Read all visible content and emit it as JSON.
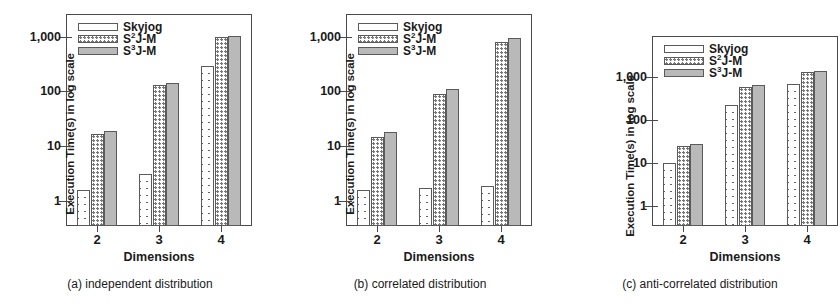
{
  "figure": {
    "background": "#ffffff",
    "series_colors": {
      "skyjog": "#ffffff",
      "s2jm": "#ffffff",
      "s3jm": "#b9b9b9",
      "axis": "#4a4a4a"
    }
  },
  "legend": {
    "entries": [
      {
        "label": "Skyjog",
        "base": "Skyjog",
        "sup": "",
        "pattern": "crosshatch"
      },
      {
        "label": "S2J-M",
        "base": "S",
        "sup": "2",
        "suffix": "J-M",
        "pattern": "dotted"
      },
      {
        "label": "S3J-M",
        "base": "S",
        "sup": "3",
        "suffix": "J-M",
        "pattern": "solid-gray"
      }
    ]
  },
  "axes": {
    "ylabel": "Execution Time(s)  in log scale",
    "xlabel": "Dimensions",
    "yticks": [
      "1",
      "10",
      "100",
      "1,000"
    ],
    "ytick_values": [
      1,
      10,
      100,
      1000
    ],
    "xticks": [
      "2",
      "3",
      "4"
    ],
    "scale": "log"
  },
  "panels": [
    {
      "id": "a",
      "caption": "(a) independent distribution",
      "ylim": [
        0.35,
        2600
      ]
    },
    {
      "id": "b",
      "caption": "(b) correlated distribution",
      "ylim": [
        0.35,
        2600
      ]
    },
    {
      "id": "c",
      "caption": "(c) anti-correlated distribution",
      "ylim": [
        0.35,
        9000
      ]
    }
  ],
  "chart_data": [
    {
      "type": "bar",
      "title": "(a) independent distribution",
      "xlabel": "Dimensions",
      "ylabel": "Execution Time(s)  in log scale",
      "yscale": "log",
      "ylim": [
        0.35,
        2600
      ],
      "yticks": [
        1,
        10,
        100,
        1000
      ],
      "ytick_labels": [
        "1",
        "10",
        "100",
        "1,000"
      ],
      "categories": [
        "2",
        "3",
        "4"
      ],
      "grid": false,
      "legend_position": "upper-left-inside",
      "series": [
        {
          "name": "Skyjog",
          "values": [
            1.6,
            3.1,
            290
          ]
        },
        {
          "name": "S2J-M",
          "values": [
            17,
            130,
            1000
          ]
        },
        {
          "name": "S3J-M",
          "values": [
            19,
            145,
            1050
          ]
        }
      ]
    },
    {
      "type": "bar",
      "title": "(b) correlated distribution",
      "xlabel": "Dimensions",
      "ylabel": "Execution Time(s)  in log scale",
      "yscale": "log",
      "ylim": [
        0.35,
        2600
      ],
      "yticks": [
        1,
        10,
        100,
        1000
      ],
      "ytick_labels": [
        "1",
        "10",
        "100",
        "1,000"
      ],
      "categories": [
        "2",
        "3",
        "4"
      ],
      "grid": false,
      "legend_position": "upper-left-inside",
      "series": [
        {
          "name": "Skyjog",
          "values": [
            1.6,
            1.7,
            1.9
          ]
        },
        {
          "name": "S2J-M",
          "values": [
            15,
            90,
            800
          ]
        },
        {
          "name": "S3J-M",
          "values": [
            18,
            110,
            950
          ]
        }
      ]
    },
    {
      "type": "bar",
      "title": "(c) anti-correlated distribution",
      "xlabel": "Dimensions",
      "ylabel": "Execution Time(s)  in log scale",
      "yscale": "log",
      "ylim": [
        0.35,
        9000
      ],
      "yticks": [
        1,
        10,
        100,
        1000
      ],
      "ytick_labels": [
        "1",
        "10",
        "100",
        "1,000"
      ],
      "categories": [
        "2",
        "3",
        "4"
      ],
      "grid": false,
      "legend_position": "upper-left-inside",
      "series": [
        {
          "name": "Skyjog",
          "values": [
            10,
            230,
            700
          ]
        },
        {
          "name": "S2J-M",
          "values": [
            25,
            600,
            1300
          ]
        },
        {
          "name": "S3J-M",
          "values": [
            28,
            650,
            1400
          ]
        }
      ]
    }
  ]
}
